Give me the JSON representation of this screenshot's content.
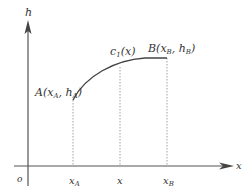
{
  "diagram": {
    "axes": {
      "y_label": "h",
      "x_label": "x",
      "origin_label": "o"
    },
    "points": {
      "A": {
        "name": "A",
        "x_sub": "A",
        "h_sub": "A",
        "label": "A(x_A, h_A)"
      },
      "B": {
        "name": "B",
        "x_sub": "B",
        "h_sub": "B",
        "label": "B(x_B, h_B)"
      }
    },
    "curve_label": {
      "main": "c",
      "sub": "1",
      "arg": "(x)"
    },
    "x_ticks": [
      {
        "main": "x",
        "sub": "A"
      },
      {
        "main": "x",
        "sub": ""
      },
      {
        "main": "x",
        "sub": "B"
      }
    ]
  }
}
